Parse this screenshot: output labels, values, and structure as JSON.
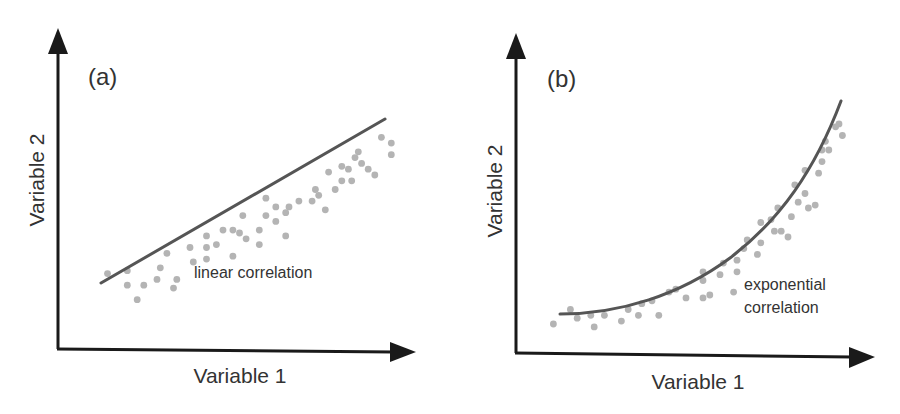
{
  "figure": {
    "panels": [
      {
        "tag": "(a)",
        "xlabel": "Variable 1",
        "ylabel": "Variable 2",
        "annotation": "linear correlation",
        "fit_type": "linear"
      },
      {
        "tag": "(b)",
        "xlabel": "Variable 1",
        "ylabel": "Variable 2",
        "annotation_line1": "exponential",
        "annotation_line2": "correlation",
        "fit_type": "exponential"
      }
    ],
    "colors": {
      "axis": "#1a1a1a",
      "fit_line": "#555555",
      "points": "#b4b4b4",
      "text": "#333333"
    }
  },
  "chart_data": [
    {
      "type": "scatter",
      "title": "(a)",
      "xlabel": "Variable 1",
      "ylabel": "Variable 2",
      "annotation": "linear correlation",
      "grid": false,
      "axis_ticks": false,
      "xlim": [
        0,
        100
      ],
      "ylim": [
        0,
        100
      ],
      "fit": {
        "type": "linear",
        "from": [
          12,
          21
        ],
        "to": [
          91,
          72
        ]
      },
      "points": [
        [
          15,
          26
        ],
        [
          21,
          27
        ],
        [
          21,
          22
        ],
        [
          24,
          17
        ],
        [
          26,
          22
        ],
        [
          30,
          24
        ],
        [
          31,
          28
        ],
        [
          33,
          33
        ],
        [
          35,
          21
        ],
        [
          36,
          24
        ],
        [
          40,
          35
        ],
        [
          41,
          30
        ],
        [
          45,
          31
        ],
        [
          45,
          39
        ],
        [
          45,
          35
        ],
        [
          48,
          36
        ],
        [
          50,
          41
        ],
        [
          53,
          41
        ],
        [
          53,
          32
        ],
        [
          55,
          40
        ],
        [
          56,
          46
        ],
        [
          57,
          38
        ],
        [
          61,
          36
        ],
        [
          61,
          41
        ],
        [
          63,
          46
        ],
        [
          63,
          52
        ],
        [
          66,
          49
        ],
        [
          66,
          44
        ],
        [
          69,
          47
        ],
        [
          69,
          39
        ],
        [
          70,
          49
        ],
        [
          73,
          51
        ],
        [
          77,
          51
        ],
        [
          78,
          55
        ],
        [
          79,
          53
        ],
        [
          81,
          48
        ],
        [
          82,
          61
        ],
        [
          84,
          55
        ],
        [
          86,
          58
        ],
        [
          86,
          63
        ],
        [
          88,
          62
        ],
        [
          89,
          58
        ],
        [
          90,
          66
        ],
        [
          91,
          68
        ],
        [
          92,
          64
        ],
        [
          94,
          62
        ],
        [
          96,
          60
        ],
        [
          98,
          73
        ],
        [
          101,
          71
        ],
        [
          101,
          67
        ]
      ]
    },
    {
      "type": "scatter",
      "title": "(b)",
      "xlabel": "Variable 1",
      "ylabel": "Variable 2",
      "annotation": "exponential correlation",
      "grid": false,
      "axis_ticks": false,
      "xlim": [
        0,
        100
      ],
      "ylim": [
        0,
        100
      ],
      "fit": {
        "type": "exponential",
        "from": [
          12,
          12
        ],
        "to": [
          90,
          79
        ]
      },
      "points": [
        [
          11,
          10
        ],
        [
          16,
          15
        ],
        [
          18,
          12
        ],
        [
          22,
          13
        ],
        [
          23,
          9
        ],
        [
          26,
          13
        ],
        [
          31,
          11
        ],
        [
          33,
          15
        ],
        [
          36,
          13
        ],
        [
          37,
          17
        ],
        [
          40,
          18
        ],
        [
          42,
          13
        ],
        [
          45,
          21
        ],
        [
          47,
          22
        ],
        [
          50,
          19
        ],
        [
          55,
          19
        ],
        [
          55,
          25
        ],
        [
          55,
          28
        ],
        [
          57,
          20
        ],
        [
          60,
          27
        ],
        [
          61,
          31
        ],
        [
          64,
          21
        ],
        [
          65,
          32
        ],
        [
          65,
          28
        ],
        [
          67,
          36
        ],
        [
          68,
          39
        ],
        [
          71,
          34
        ],
        [
          72,
          38
        ],
        [
          72,
          45
        ],
        [
          75,
          46
        ],
        [
          76,
          42
        ],
        [
          77,
          50
        ],
        [
          78,
          42
        ],
        [
          80,
          40
        ],
        [
          81,
          47
        ],
        [
          82,
          58
        ],
        [
          83,
          52
        ],
        [
          85,
          55
        ],
        [
          85,
          63
        ],
        [
          86,
          50
        ],
        [
          88,
          51
        ],
        [
          89,
          62
        ],
        [
          90,
          66
        ],
        [
          90,
          70
        ],
        [
          91,
          73
        ],
        [
          92,
          70
        ],
        [
          94,
          78
        ],
        [
          95,
          79
        ],
        [
          96,
          75
        ]
      ]
    }
  ]
}
